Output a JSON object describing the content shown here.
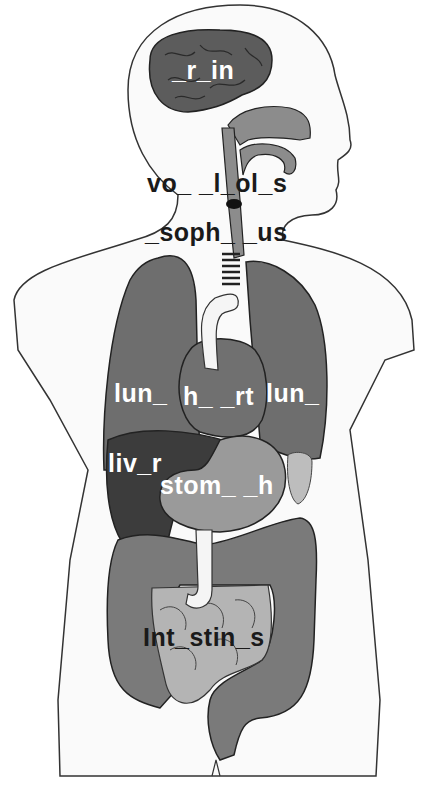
{
  "diagram": {
    "type": "human-anatomy-fill-in-the-blank",
    "colors": {
      "background": "#ffffff",
      "body_outline": "#333333",
      "body_fill": "#fafafa",
      "brain": "#5c5c5c",
      "lungs": "#6e6e6e",
      "heart": "#707070",
      "liver": "#3c3c3c",
      "stomach": "#9a9a9a",
      "large_intestine": "#7a7a7a",
      "small_intestine": "#b4b4b4",
      "esophagus": "#8c8c8c",
      "spleen": "#bdbdbd",
      "aorta": "#f5f5f5"
    },
    "labels": {
      "brain": "_r_in",
      "vocal_cords": "vo_ _l_ol_s",
      "esophagus": "_soph_ _us",
      "lung_left": "lun_",
      "heart": "h_ _rt",
      "lung_right": "lun_",
      "liver": "liv_r",
      "stomach": "stom_ _h",
      "intestines": "Int_stin_s"
    }
  }
}
